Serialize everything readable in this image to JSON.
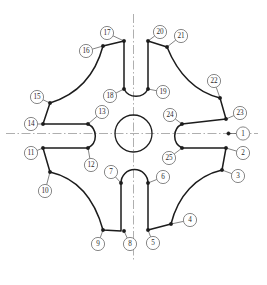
{
  "drawing": {
    "title": "Cross-shaped plate outline with numbered callouts",
    "background_color": "#ffffff",
    "line_color": "#1c1c1c",
    "centerline_color": "#9a9a9a",
    "balloon_text_color": "#2b2b2b",
    "center": {
      "x": 133.5,
      "y": 133.5
    },
    "bore_radius": 18.5,
    "centerlines": {
      "horizontal": {
        "x1": 6,
        "y1": 133.5,
        "x2": 258,
        "y2": 133.5
      },
      "vertical": {
        "x1": 133.5,
        "y1": 14,
        "x2": 133.5,
        "y2": 262
      }
    },
    "callouts": [
      {
        "id": "1",
        "label": "1",
        "bx": 243,
        "by": 133.5,
        "px": 228.5,
        "py": 133.5
      },
      {
        "id": "2",
        "label": "2",
        "bx": 243,
        "by": 153,
        "px": 226,
        "py": 148
      },
      {
        "id": "3",
        "label": "3",
        "bx": 238,
        "by": 176,
        "px": 222,
        "py": 170
      },
      {
        "id": "4",
        "label": "4",
        "bx": 190,
        "by": 220,
        "px": 171,
        "py": 224
      },
      {
        "id": "5",
        "label": "5",
        "bx": 153,
        "by": 243,
        "px": 148,
        "py": 230
      },
      {
        "id": "6",
        "label": "6",
        "bx": 163,
        "by": 177,
        "px": 148,
        "py": 183
      },
      {
        "id": "7",
        "label": "7",
        "bx": 111,
        "by": 172,
        "px": 121,
        "py": 183
      },
      {
        "id": "8",
        "label": "8",
        "bx": 130,
        "by": 244,
        "px": 124,
        "py": 231
      },
      {
        "id": "9",
        "label": "9",
        "bx": 98,
        "by": 244,
        "px": 103,
        "py": 230
      },
      {
        "id": "10",
        "label": "10",
        "bx": 45,
        "by": 191,
        "px": 50,
        "py": 172
      },
      {
        "id": "11",
        "label": "11",
        "bx": 31,
        "by": 153,
        "px": 43,
        "py": 148
      },
      {
        "id": "12",
        "label": "12",
        "bx": 91,
        "by": 165,
        "px": 88,
        "py": 148
      },
      {
        "id": "13",
        "label": "13",
        "bx": 102,
        "by": 112,
        "px": 88,
        "py": 124
      },
      {
        "id": "14",
        "label": "14",
        "bx": 31,
        "by": 124,
        "px": 43,
        "py": 124
      },
      {
        "id": "15",
        "label": "15",
        "bx": 37,
        "by": 97,
        "px": 50,
        "py": 103
      },
      {
        "id": "16",
        "label": "16",
        "bx": 86,
        "by": 51,
        "px": 103,
        "py": 46
      },
      {
        "id": "17",
        "label": "17",
        "bx": 107,
        "by": 33,
        "px": 124,
        "py": 41
      },
      {
        "id": "18",
        "label": "18",
        "bx": 110,
        "by": 96,
        "px": 124,
        "py": 89
      },
      {
        "id": "19",
        "label": "19",
        "bx": 163,
        "by": 92,
        "px": 148,
        "py": 89
      },
      {
        "id": "20",
        "label": "20",
        "bx": 160,
        "by": 32,
        "px": 148,
        "py": 41
      },
      {
        "id": "21",
        "label": "21",
        "bx": 181,
        "by": 36,
        "px": 167,
        "py": 47
      },
      {
        "id": "22",
        "label": "22",
        "bx": 214,
        "by": 81,
        "px": 220,
        "py": 98
      },
      {
        "id": "23",
        "label": "23",
        "bx": 240,
        "by": 113,
        "px": 226,
        "py": 119
      },
      {
        "id": "24",
        "label": "24",
        "bx": 170,
        "by": 115,
        "px": 182,
        "py": 124
      },
      {
        "id": "25",
        "label": "25",
        "bx": 169,
        "by": 158,
        "px": 182,
        "py": 148
      }
    ],
    "nodes": [
      {
        "x": 228.5,
        "y": 133.5
      },
      {
        "x": 226,
        "y": 119
      },
      {
        "x": 226,
        "y": 148
      },
      {
        "x": 222,
        "y": 170
      },
      {
        "x": 171,
        "y": 224
      },
      {
        "x": 148,
        "y": 230
      },
      {
        "x": 148,
        "y": 183
      },
      {
        "x": 121,
        "y": 183
      },
      {
        "x": 124,
        "y": 231
      },
      {
        "x": 103,
        "y": 230
      },
      {
        "x": 50,
        "y": 172
      },
      {
        "x": 43,
        "y": 148
      },
      {
        "x": 88,
        "y": 148
      },
      {
        "x": 88,
        "y": 124
      },
      {
        "x": 43,
        "y": 124
      },
      {
        "x": 50,
        "y": 103
      },
      {
        "x": 103,
        "y": 46
      },
      {
        "x": 124,
        "y": 41
      },
      {
        "x": 124,
        "y": 89
      },
      {
        "x": 148,
        "y": 89
      },
      {
        "x": 148,
        "y": 41
      },
      {
        "x": 167,
        "y": 47
      },
      {
        "x": 220,
        "y": 98
      },
      {
        "x": 182,
        "y": 124
      },
      {
        "x": 182,
        "y": 148
      }
    ],
    "outline_path": "M 124 41 L 124 89 A 13.5 13.5 0 0 0 148 89 L 148 41 L 167 47 C 178 74 196 92 220 98 L 226 119 L 182 124 A 13.5 13.5 0 0 0 182 148 L 226 148 L 222 170 C 196 176 178 196 171 224 L 148 230 L 148 183 A 13.5 13.5 0 0 0 121 183 L 121 231 L 103 230 C 94 197 76 178 50 172 L 43 148 L 88 148 A 13.5 13.5 0 0 0 88 124 L 43 124 L 50 103 C 76 95 95 76 103 46 Z"
  }
}
